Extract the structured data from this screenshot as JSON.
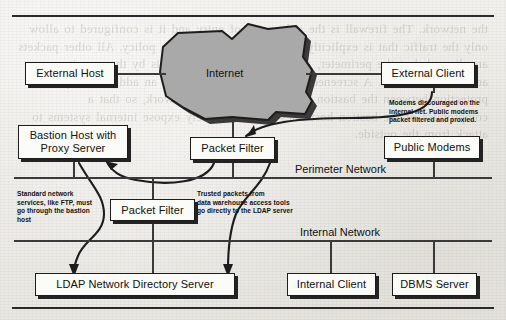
{
  "page": {
    "background_color": "#efefeb",
    "ink_color": "#1d1d1d",
    "cloud_fill": "#a9a9a9",
    "ghost_text": "the network. The firewall is the only point of entry and it is configured to allow only the traffic that is explicitly permitted by the security policy. All other packets are discarded at the perimeter, and logged for later analysis by the security administration staff. A screened subnet architecture places an additional layer of protection between the bastion host and the internal network, so that a compromise of the bastion host does not immediately expose internal systems to attack from the outside."
  },
  "diagram": {
    "title_cloud": "Internet",
    "boxes": [
      {
        "id": "external-host",
        "label": "External Host"
      },
      {
        "id": "external-client",
        "label": "External Client"
      },
      {
        "id": "bastion-host",
        "label": "Bastion Host with\nProxy Server"
      },
      {
        "id": "packet-filter-top",
        "label": "Packet Filter"
      },
      {
        "id": "public-modems",
        "label": "Public Modems"
      },
      {
        "id": "packet-filter-mid",
        "label": "Packet Filter"
      },
      {
        "id": "ldap-server",
        "label": "LDAP Network Directory Server"
      },
      {
        "id": "internal-client",
        "label": "Internal Client"
      },
      {
        "id": "dbms-server",
        "label": "DBMS Server"
      }
    ],
    "segments": [
      {
        "id": "perimeter-network",
        "label": "Perimeter Network"
      },
      {
        "id": "internal-network",
        "label": "Internal Network"
      }
    ],
    "notes": [
      {
        "id": "modems-note",
        "text": "Modems discouraged on the\ninternal net. Public modems\npacket filtered and proxied."
      },
      {
        "id": "bastion-note",
        "text": "Standard network\nservices, like FTP, must\ngo through the bastion\nhost"
      },
      {
        "id": "trusted-note",
        "text": "Trusted packets from\ndata warehouse access tools\ngo directly to the LDAP server"
      }
    ]
  }
}
